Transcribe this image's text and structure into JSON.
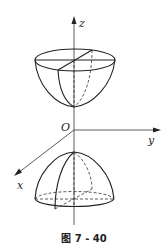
{
  "figure": {
    "caption": "图 7 - 40",
    "axes": {
      "z_label": "z",
      "y_label": "y",
      "x_label": "x",
      "origin_label": "O"
    },
    "surfaces": [
      {
        "name": "upper-paraboloid",
        "description": "bowl opening upward, vertex on positive z-axis above origin"
      },
      {
        "name": "lower-dome",
        "description": "dome (elliptic paraboloid cap) opening downward, below origin"
      }
    ],
    "colors": {
      "stroke": "#222222",
      "background": "#ffffff"
    }
  }
}
